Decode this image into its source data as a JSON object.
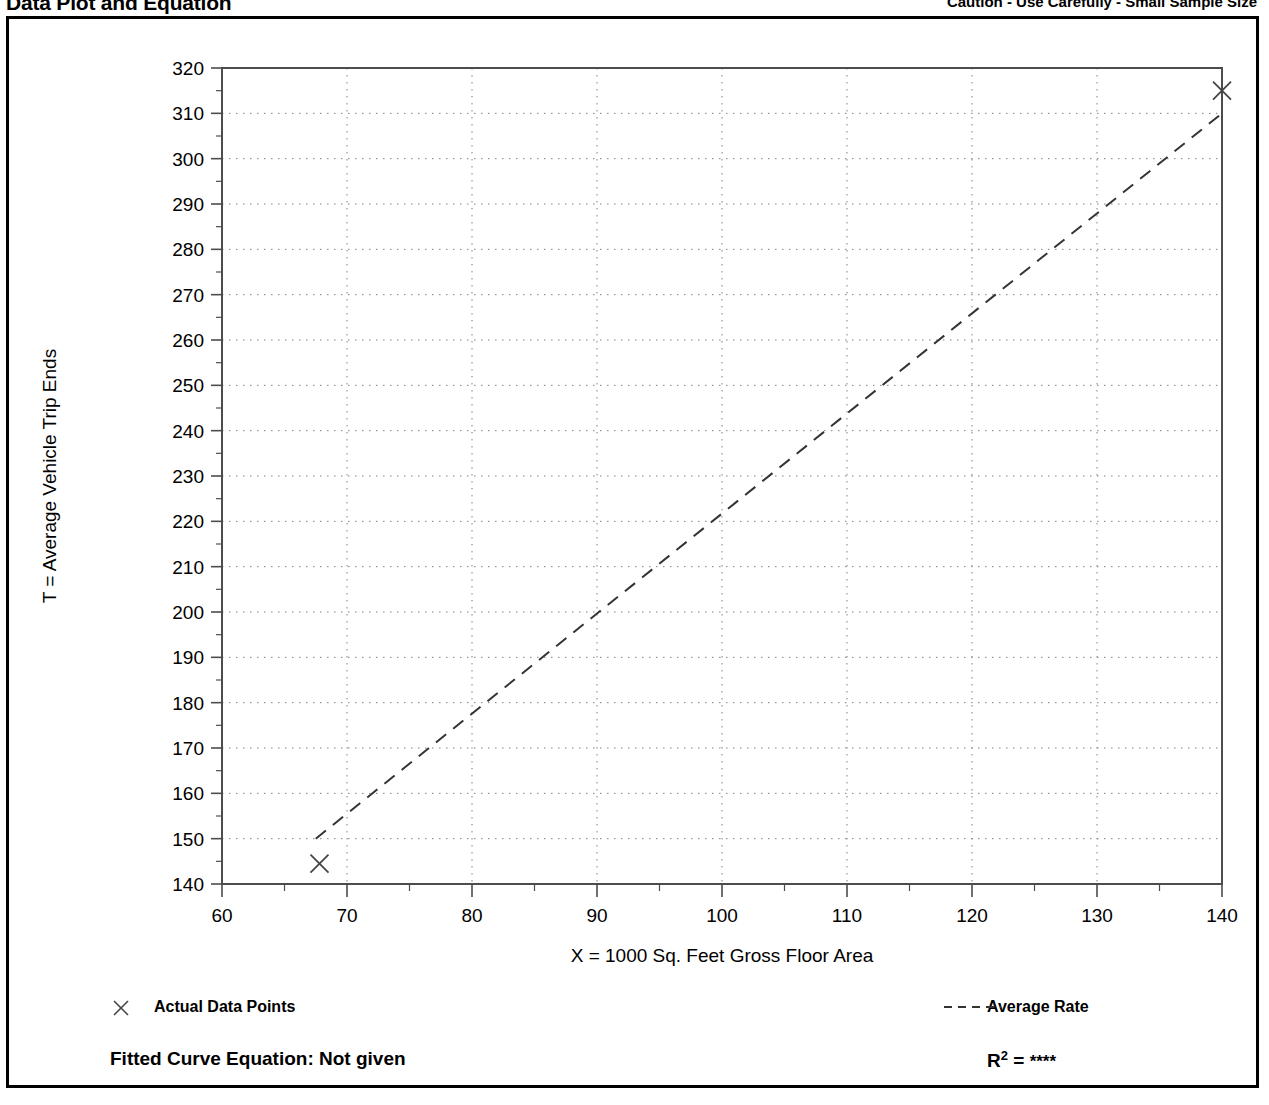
{
  "header": {
    "left_title": "Data Plot and Equation",
    "right_note": "Caution - Use Carefully - Small Sample Size"
  },
  "legend": {
    "data_points_label": "Actual Data Points",
    "data_points_marker": "x-cross-marker",
    "average_rate_label": "Average Rate",
    "average_rate_marker": "dashed-line"
  },
  "footer": {
    "fitted_equation_label": "Fitted Curve Equation:  Not given",
    "r_squared_prefix": "R",
    "r_squared_exponent": "2",
    "r_squared_equals": " = ",
    "r_squared_value": "****"
  },
  "colors": {
    "ink": "#000000",
    "grid": "#808080",
    "axis": "#4d4d4d",
    "background": "#ffffff"
  },
  "chart_data": {
    "type": "scatter",
    "title": "",
    "xlabel": "X = 1000 Sq. Feet Gross Floor Area",
    "ylabel": "T = Average Vehicle Trip Ends",
    "xlim": [
      60,
      140
    ],
    "ylim": [
      140,
      320
    ],
    "x_major_step": 10,
    "x_minor_step": 5,
    "y_major_step": 10,
    "y_minor_step": 5,
    "x_ticks": [
      60,
      70,
      80,
      90,
      100,
      110,
      120,
      130,
      140
    ],
    "y_ticks": [
      140,
      150,
      160,
      170,
      180,
      190,
      200,
      210,
      220,
      230,
      240,
      250,
      260,
      270,
      280,
      290,
      300,
      310,
      320
    ],
    "grid": "dotted-major-both-axes",
    "legend_position": "below-axes",
    "series": [
      {
        "name": "Actual Data Points",
        "type": "scatter",
        "marker": "x",
        "points": [
          {
            "x": 67.8,
            "y": 144.5
          },
          {
            "x": 140.0,
            "y": 315.0
          }
        ]
      },
      {
        "name": "Average Rate",
        "type": "line",
        "style": "dashed",
        "points": [
          {
            "x": 67.5,
            "y": 150.0
          },
          {
            "x": 140.0,
            "y": 310.0
          }
        ]
      }
    ]
  }
}
